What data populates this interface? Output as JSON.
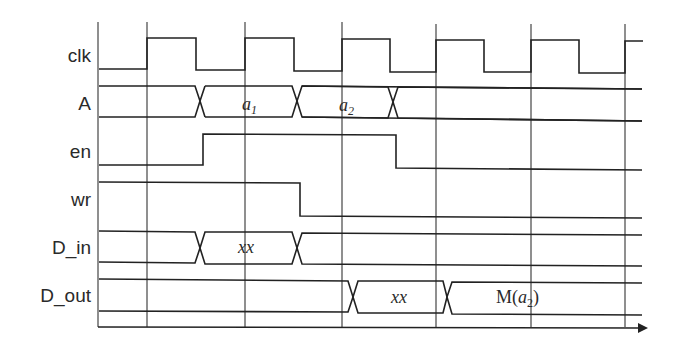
{
  "diagram": {
    "type": "timing-diagram",
    "signals": [
      {
        "name": "clk",
        "label": "clk"
      },
      {
        "name": "A",
        "label": "A",
        "values": [
          {
            "text": "a",
            "sub": "1"
          },
          {
            "text": "a",
            "sub": "2"
          }
        ]
      },
      {
        "name": "en",
        "label": "en"
      },
      {
        "name": "wr",
        "label": "wr"
      },
      {
        "name": "D_in",
        "label": "D_in",
        "values": [
          {
            "text": "xx"
          }
        ]
      },
      {
        "name": "D_out",
        "label": "D_out",
        "values": [
          {
            "text": "xx"
          },
          {
            "text_prefix": "M(",
            "text": "a",
            "sub": "2",
            "text_suffix": ")"
          }
        ]
      }
    ],
    "clock_cycles": 6,
    "time_axis": "arrow"
  }
}
